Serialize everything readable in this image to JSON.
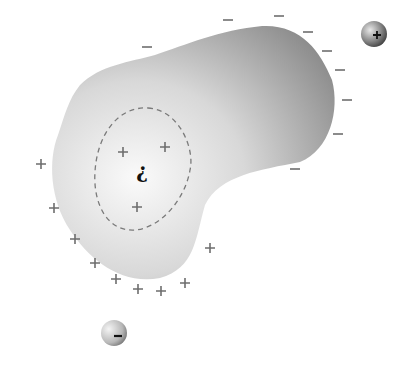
{
  "diagram": {
    "body_colors": {
      "light": "#fafafa",
      "mid": "#dcdcdc",
      "dark": "#8c8c8c"
    },
    "dashed_region": {
      "stroke": "#7a7a7a"
    },
    "center_symbol": "¿",
    "external_positive_sphere": {
      "label": "+",
      "cx": 374,
      "cy": 34,
      "r": 13
    },
    "external_negative_sphere": {
      "label": "–",
      "cx": 114,
      "cy": 333,
      "r": 13
    },
    "minus_signs": [
      {
        "x": 228,
        "y": 20
      },
      {
        "x": 279,
        "y": 16
      },
      {
        "x": 308,
        "y": 32
      },
      {
        "x": 327,
        "y": 51
      },
      {
        "x": 340,
        "y": 70
      },
      {
        "x": 347,
        "y": 100
      },
      {
        "x": 338,
        "y": 134
      },
      {
        "x": 295,
        "y": 169
      },
      {
        "x": 147,
        "y": 47
      }
    ],
    "plus_signs_outer": [
      {
        "x": 41,
        "y": 164
      },
      {
        "x": 54,
        "y": 208
      },
      {
        "x": 75,
        "y": 239
      },
      {
        "x": 95,
        "y": 263
      },
      {
        "x": 116,
        "y": 279
      },
      {
        "x": 138,
        "y": 289
      },
      {
        "x": 161,
        "y": 291
      },
      {
        "x": 185,
        "y": 283
      },
      {
        "x": 210,
        "y": 248
      }
    ],
    "plus_signs_inner": [
      {
        "x": 123,
        "y": 152
      },
      {
        "x": 165,
        "y": 147
      },
      {
        "x": 137,
        "y": 207
      }
    ]
  }
}
